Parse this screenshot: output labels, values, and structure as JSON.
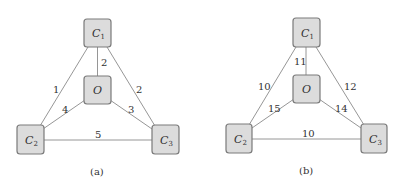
{
  "panels": [
    {
      "id": "a",
      "caption": "(a)",
      "nodes": [
        {
          "id": "C1",
          "label": "C",
          "sub": "1"
        },
        {
          "id": "O",
          "label": "O",
          "sub": ""
        },
        {
          "id": "C2",
          "label": "C",
          "sub": "2"
        },
        {
          "id": "C3",
          "label": "C",
          "sub": "3"
        }
      ],
      "edges": [
        {
          "from": "C1",
          "to": "O",
          "weight": "2"
        },
        {
          "from": "C1",
          "to": "C2",
          "weight": "1"
        },
        {
          "from": "C1",
          "to": "C3",
          "weight": "2"
        },
        {
          "from": "O",
          "to": "C2",
          "weight": "4"
        },
        {
          "from": "O",
          "to": "C3",
          "weight": "3"
        },
        {
          "from": "C2",
          "to": "C3",
          "weight": "5"
        }
      ]
    },
    {
      "id": "b",
      "caption": "(b)",
      "nodes": [
        {
          "id": "C1",
          "label": "C",
          "sub": "1"
        },
        {
          "id": "O",
          "label": "O",
          "sub": ""
        },
        {
          "id": "C2",
          "label": "C",
          "sub": "2"
        },
        {
          "id": "C3",
          "label": "C",
          "sub": "3"
        }
      ],
      "edges": [
        {
          "from": "C1",
          "to": "O",
          "weight": "11"
        },
        {
          "from": "C1",
          "to": "C2",
          "weight": "10"
        },
        {
          "from": "C1",
          "to": "C3",
          "weight": "12"
        },
        {
          "from": "O",
          "to": "C2",
          "weight": "15"
        },
        {
          "from": "O",
          "to": "C3",
          "weight": "14"
        },
        {
          "from": "C2",
          "to": "C3",
          "weight": "10"
        }
      ]
    }
  ]
}
